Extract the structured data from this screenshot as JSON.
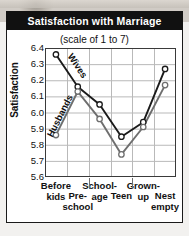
{
  "figure": {
    "title": "Satisfaction with Marriage",
    "subtitle": "(scale of 1 to 7)",
    "y_axis_title": "Satisfaction",
    "colors": {
      "title_bar_background": "#111111",
      "title_text": "#ffffff",
      "plot_background": "#ffffff",
      "gridline": "#b9b9b9",
      "axis": "#3a3a3a",
      "wives_line": "#1a1a1a",
      "husbands_line": "#6e6e6e",
      "marker_fill": "#ffffff",
      "text": "#111111"
    }
  },
  "chart_data": {
    "type": "line",
    "title": "Satisfaction with Marriage",
    "subtitle": "(scale of 1 to 7)",
    "xlabel": "",
    "ylabel": "Satisfaction",
    "ylim": [
      5.6,
      6.4
    ],
    "yticks": [
      6.4,
      6.3,
      6.2,
      6.1,
      6.0,
      5.9,
      5.8,
      5.7,
      5.6
    ],
    "ytick_labels": [
      "6.4",
      "6.3",
      "6.2",
      "6.1",
      "6.0",
      "5.9",
      "5.8",
      "5.7",
      "5.6"
    ],
    "grid": true,
    "legend": "inline-labels",
    "categories": [
      "Before kids",
      "Pre-school",
      "School-age",
      "Teen",
      "Grown-up",
      "Nest empty"
    ],
    "category_label_lines": [
      [
        "Before",
        "kids"
      ],
      [
        "Pre-",
        "school"
      ],
      [
        "School-",
        "age"
      ],
      [
        "Teen"
      ],
      [
        "Grown-",
        "up"
      ],
      [
        "Nest",
        "empty"
      ]
    ],
    "series": [
      {
        "name": "Wives",
        "values": [
          6.36,
          6.16,
          6.05,
          5.85,
          5.94,
          6.27
        ]
      },
      {
        "name": "Husbands",
        "values": [
          5.86,
          6.13,
          5.96,
          5.74,
          5.91,
          6.17
        ]
      }
    ],
    "annotations": [
      {
        "text": "Wives",
        "attached_to": "Wives"
      },
      {
        "text": "Husbands",
        "attached_to": "Husbands"
      }
    ]
  }
}
